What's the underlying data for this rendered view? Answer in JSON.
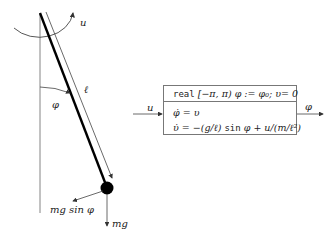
{
  "pendulum": {
    "labels": {
      "torque": "u",
      "length": "ℓ",
      "angle": "φ",
      "tangential_force": "mg sin φ",
      "gravity": "mg"
    }
  },
  "block": {
    "input_label": "u",
    "output_label": "φ",
    "declaration": {
      "keyword": "real",
      "rest": " [−π, π) φ := φ₀; υ= 0"
    },
    "equations": [
      {
        "lhs": "φ̇",
        "rhs": " = υ"
      },
      {
        "lhs": "υ̇",
        "rhs_pre": " = −(g/ℓ) ",
        "fn": "sin",
        "rhs_post": " φ + u/(m/ℓ²)"
      }
    ]
  },
  "colors": {
    "rod": "#000000",
    "lines": "#555555",
    "box_border": "#777777"
  }
}
